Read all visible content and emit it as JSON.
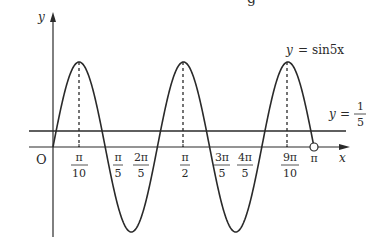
{
  "diagram": {
    "title_fragment": "g",
    "axes": {
      "x_label": "x",
      "y_label": "y",
      "origin_label": "O"
    },
    "curves": [
      {
        "name": "sine",
        "equation_label": "y = sin5x",
        "lhs": "y",
        "eq": "=",
        "rhs": "sin5x"
      },
      {
        "name": "horizontal-line",
        "equation_label": "y = 1/5",
        "lhs": "y",
        "eq": "=",
        "num": "1",
        "den": "5"
      }
    ],
    "x_ticks": [
      {
        "num": "π",
        "den": "10",
        "value": "π/10"
      },
      {
        "num": "π",
        "den": "5",
        "value": "π/5"
      },
      {
        "num": "2π",
        "den": "5",
        "value": "2π/5"
      },
      {
        "num": "π",
        "den": "2",
        "value": "π/2"
      },
      {
        "num": "3π",
        "den": "5",
        "value": "3π/5"
      },
      {
        "num": "4π",
        "den": "5",
        "value": "4π/5"
      },
      {
        "num": "9π",
        "den": "10",
        "value": "9π/10"
      },
      {
        "num": "π",
        "den": "",
        "value": "π"
      }
    ],
    "endpoint": {
      "x": "π",
      "style": "open-circle"
    },
    "domain": "[0, π)",
    "colors": {
      "stroke": "#2a2a2a",
      "background": "#ffffff"
    }
  }
}
